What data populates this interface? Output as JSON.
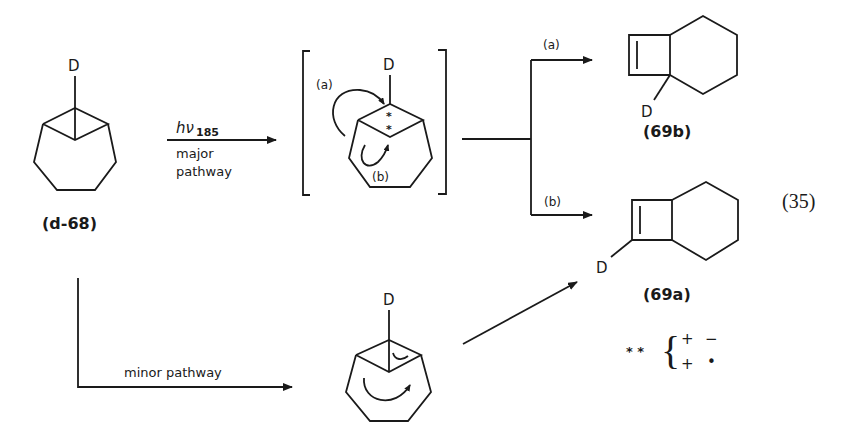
{
  "equation_number": "(35)",
  "reactant": {
    "label": "(d-68)",
    "substituent": "D"
  },
  "major_arrow": {
    "reagent_symbol": "hν",
    "reagent_subscript": "185",
    "line1": "major",
    "line2": "pathway"
  },
  "intermediate": {
    "substituent": "D",
    "path_a": "(a)",
    "path_b": "(b)",
    "radical_marks": [
      "*",
      "*"
    ]
  },
  "branch": {
    "upper_label": "(a)",
    "lower_label": "(b)"
  },
  "product_b": {
    "label": "(69b)",
    "substituent": "D"
  },
  "product_a": {
    "label": "(69a)",
    "substituent": "D"
  },
  "minor_arrow": {
    "label": "minor pathway"
  },
  "minor_intermediate": {
    "substituent": "D"
  },
  "legend": {
    "symbol": "* *",
    "row1": [
      "+",
      "−"
    ],
    "row2": [
      "+",
      "•"
    ]
  }
}
